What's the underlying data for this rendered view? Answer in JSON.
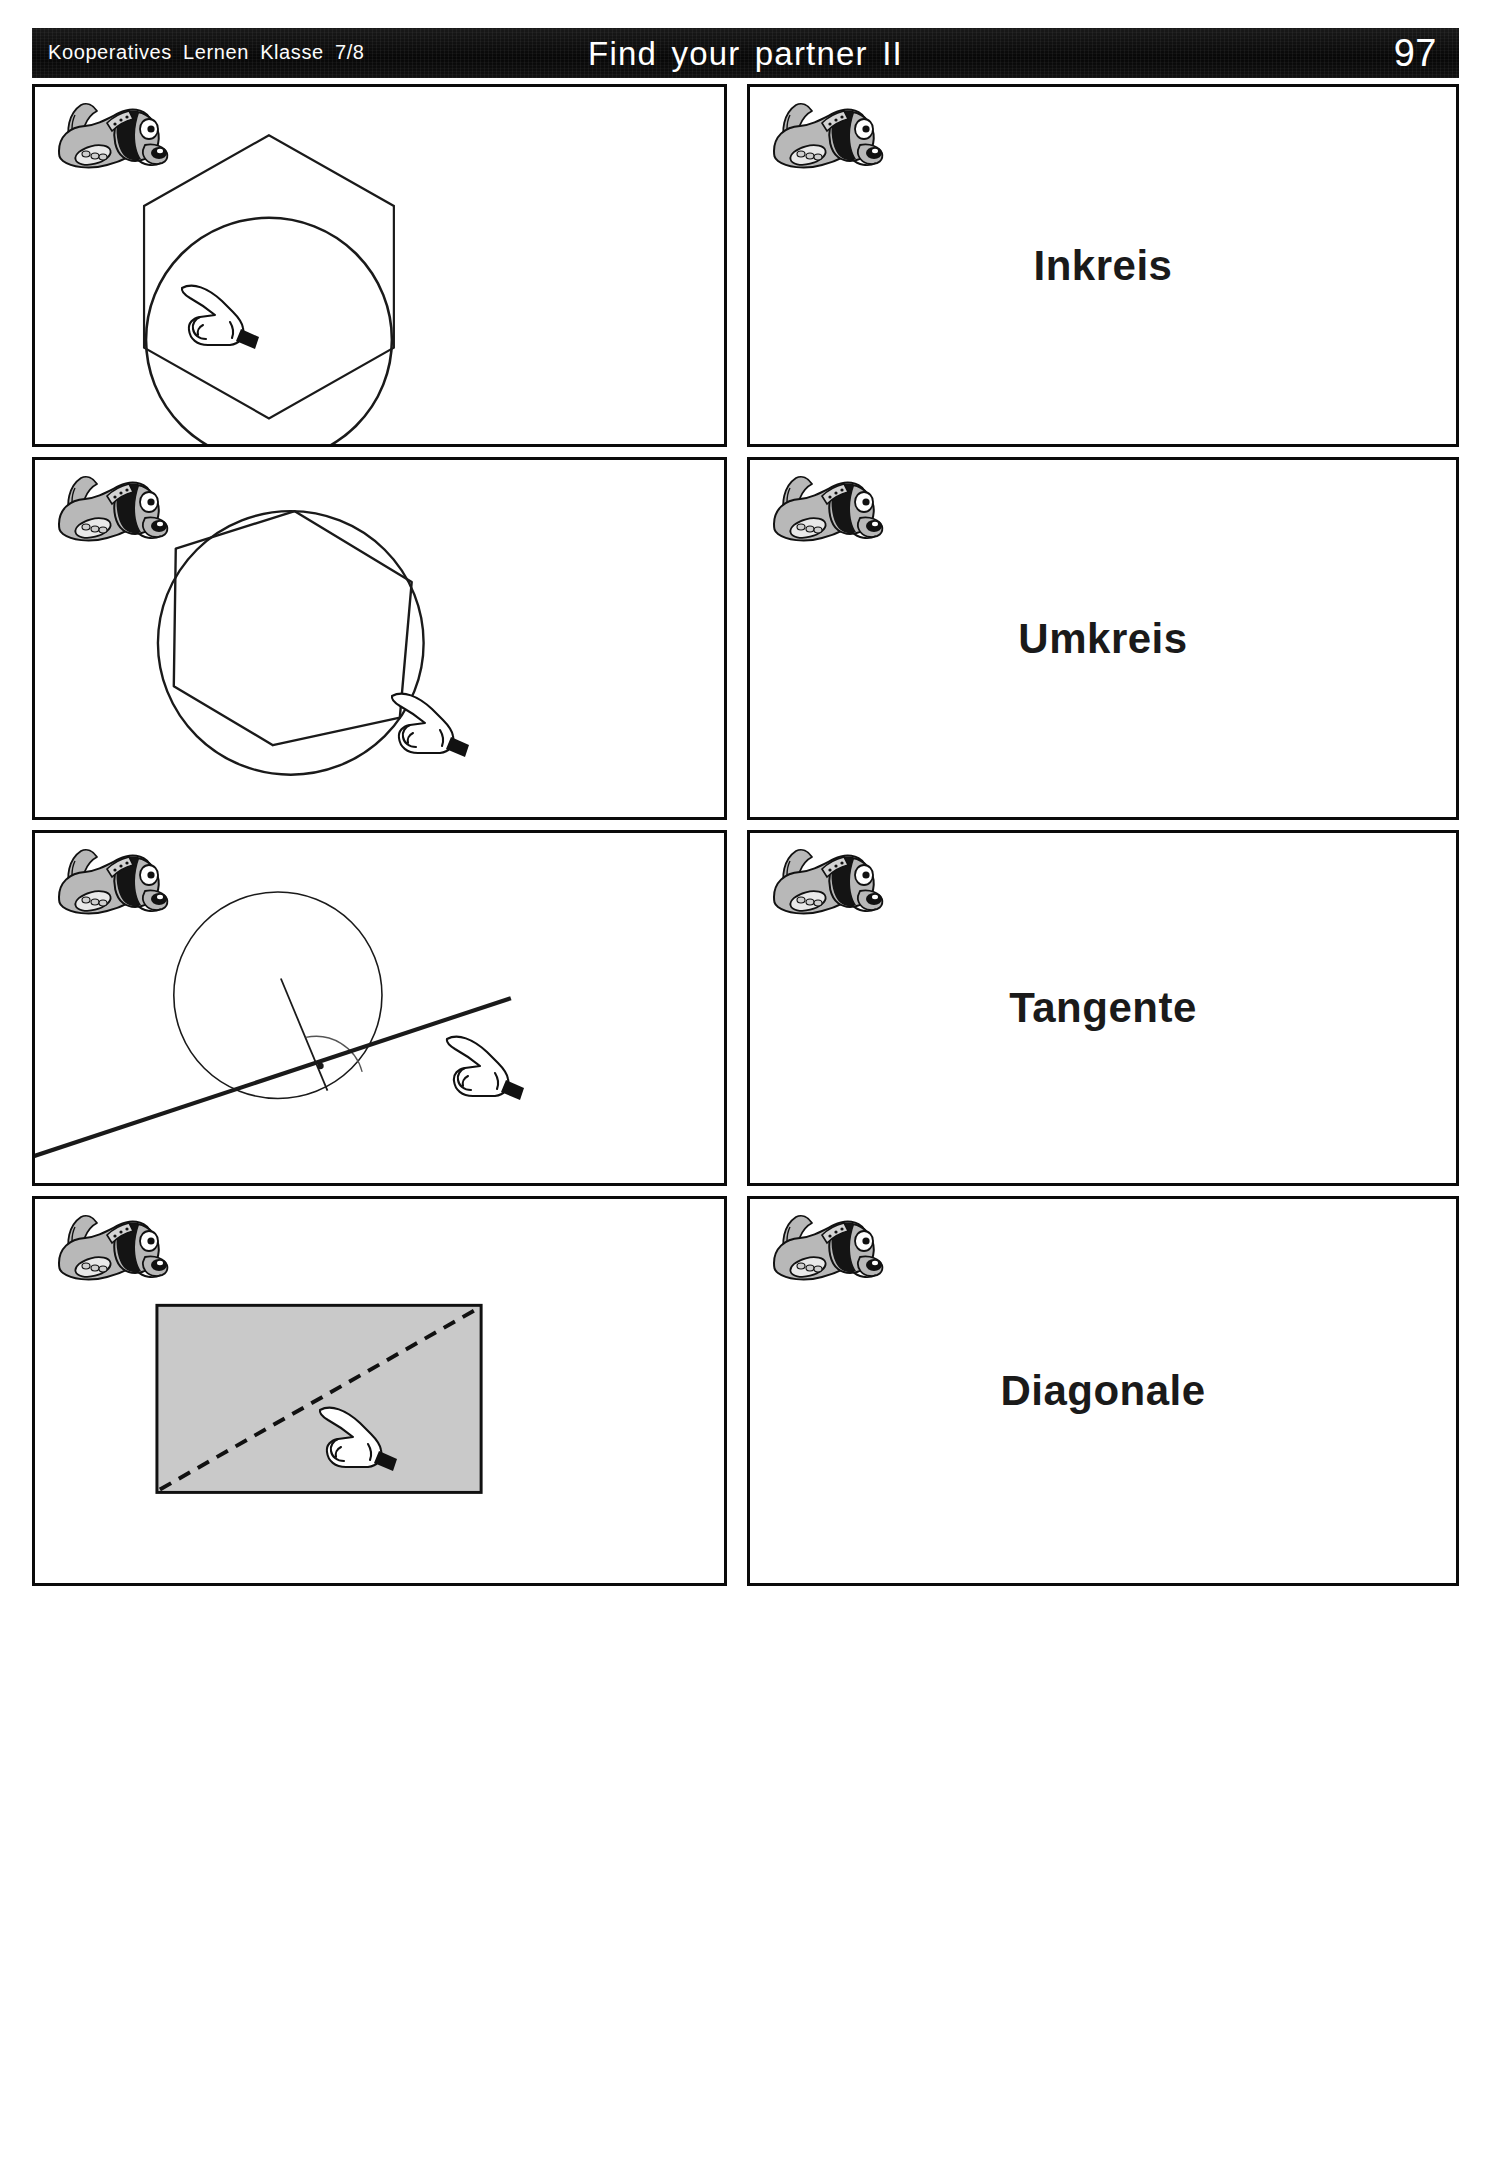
{
  "header": {
    "series_label": "Kooperatives Lernen  Klasse  7/8",
    "title": "Find your partner II",
    "page_number": "97",
    "background_color": "#0d0d0d",
    "text_color": "#ffffff"
  },
  "worksheet": {
    "card_border_color": "#0a0a0a",
    "figure_stroke_color": "#1a1a1a",
    "rectangle_fill_color": "#c9c9c9",
    "mascot_icon": "dog-mascot-icon",
    "hand_icon": "pointing-hand-icon",
    "pairs": [
      {
        "figure_name": "hexagon-with-inscribed-circle",
        "figure_description": "Regelmäßiges Sechseck mit einbeschriebenem Kreis",
        "term": "Inkreis"
      },
      {
        "figure_name": "hexagon-inscribed-in-circle",
        "figure_description": "Regelmäßiges Sechseck mit umbeschriebenem Kreis",
        "term": "Umkreis"
      },
      {
        "figure_name": "circle-with-tangent-line",
        "figure_description": "Kreis mit Berührgerade und rechtem Winkel zum Radius",
        "term": "Tangente"
      },
      {
        "figure_name": "rectangle-with-dashed-diagonal",
        "figure_description": "Graues Rechteck mit gestrichelter Diagonale",
        "term": "Diagonale"
      }
    ]
  }
}
